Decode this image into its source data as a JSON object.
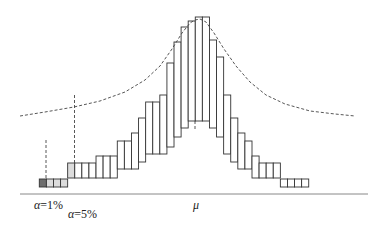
{
  "diagram": {
    "type": "stepped-box-histogram",
    "baseline": {
      "x1": 20,
      "x2": 368,
      "y": 194,
      "color": "#888888"
    },
    "column_width": 7.09,
    "column_start_x": 39.3,
    "columns": [
      {
        "top": 179,
        "bottom": 187,
        "fill": "#6e6e6e"
      },
      {
        "top": 179,
        "bottom": 187,
        "fill": "#dcdcdc"
      },
      {
        "top": 179,
        "bottom": 187,
        "fill": "#dcdcdc"
      },
      {
        "top": 179,
        "bottom": 187,
        "fill": "#dcdcdc"
      },
      {
        "top": 163,
        "bottom": 178,
        "fill": "#dcdcdc"
      },
      {
        "top": 163,
        "bottom": 178,
        "fill": "#ffffff"
      },
      {
        "top": 163,
        "bottom": 178,
        "fill": "#ffffff"
      },
      {
        "top": 163,
        "bottom": 178,
        "fill": "#ffffff"
      },
      {
        "top": 156,
        "bottom": 178,
        "fill": "#ffffff"
      },
      {
        "top": 156,
        "bottom": 178,
        "fill": "#ffffff"
      },
      {
        "top": 156,
        "bottom": 178,
        "fill": "#ffffff"
      },
      {
        "top": 141,
        "bottom": 169,
        "fill": "#ffffff"
      },
      {
        "top": 141,
        "bottom": 169,
        "fill": "#ffffff"
      },
      {
        "top": 133,
        "bottom": 169,
        "fill": "#ffffff"
      },
      {
        "top": 118,
        "bottom": 162,
        "fill": "#ffffff"
      },
      {
        "top": 102,
        "bottom": 154,
        "fill": "#ffffff"
      },
      {
        "top": 102,
        "bottom": 154,
        "fill": "#ffffff"
      },
      {
        "top": 95,
        "bottom": 154,
        "fill": "#ffffff"
      },
      {
        "top": 63,
        "bottom": 147,
        "fill": "#ffffff"
      },
      {
        "top": 42,
        "bottom": 137,
        "fill": "#ffffff"
      },
      {
        "top": 27,
        "bottom": 128,
        "fill": "#ffffff"
      },
      {
        "top": 21,
        "bottom": 121,
        "fill": "#ffffff"
      },
      {
        "top": 17,
        "bottom": 121,
        "fill": "#ffffff"
      },
      {
        "top": 17,
        "bottom": 121,
        "fill": "#ffffff"
      },
      {
        "top": 40,
        "bottom": 128,
        "fill": "#ffffff"
      },
      {
        "top": 57,
        "bottom": 137,
        "fill": "#ffffff"
      },
      {
        "top": 95,
        "bottom": 154,
        "fill": "#ffffff"
      },
      {
        "top": 118,
        "bottom": 162,
        "fill": "#ffffff"
      },
      {
        "top": 133,
        "bottom": 169,
        "fill": "#ffffff"
      },
      {
        "top": 141,
        "bottom": 169,
        "fill": "#ffffff"
      },
      {
        "top": 156,
        "bottom": 178,
        "fill": "#ffffff"
      },
      {
        "top": 163,
        "bottom": 178,
        "fill": "#ffffff"
      },
      {
        "top": 163,
        "bottom": 178,
        "fill": "#ffffff"
      },
      {
        "top": 163,
        "bottom": 178,
        "fill": "#ffffff"
      },
      {
        "top": 179,
        "bottom": 187,
        "fill": "#ffffff"
      },
      {
        "top": 179,
        "bottom": 187,
        "fill": "#ffffff"
      },
      {
        "top": 179,
        "bottom": 187,
        "fill": "#ffffff"
      },
      {
        "top": 179,
        "bottom": 187,
        "fill": "#ffffff"
      }
    ],
    "stroke_color": "#333333",
    "curve": {
      "style": "dashed",
      "color": "#444444",
      "points": [
        [
          20,
          116
        ],
        [
          45,
          112
        ],
        [
          74,
          107
        ],
        [
          100,
          101
        ],
        [
          125,
          92
        ],
        [
          145,
          80
        ],
        [
          160,
          66
        ],
        [
          172,
          49
        ],
        [
          182,
          33
        ],
        [
          190,
          23
        ],
        [
          195,
          20
        ],
        [
          200,
          19
        ],
        [
          206,
          22
        ],
        [
          214,
          33
        ],
        [
          224,
          49
        ],
        [
          236,
          66
        ],
        [
          250,
          82
        ],
        [
          266,
          95
        ],
        [
          285,
          104
        ],
        [
          310,
          111
        ],
        [
          335,
          114
        ],
        [
          355,
          116
        ]
      ]
    },
    "markers": [
      {
        "name": "alpha-1-marker",
        "x": 46,
        "y1": 140,
        "y2": 179
      },
      {
        "name": "alpha-5-marker",
        "x": 74.5,
        "y1": 95,
        "y2": 163
      },
      {
        "name": "mu-marker",
        "x": 195,
        "y1": 121,
        "y2": 129
      }
    ],
    "labels": {
      "alpha1": {
        "symbol": "α",
        "text": "=1%",
        "x": 34,
        "y": 198
      },
      "alpha5": {
        "symbol": "α",
        "text": "=5%",
        "x": 68,
        "y": 207
      },
      "mu": {
        "symbol": "μ",
        "x": 193,
        "y": 198
      }
    }
  }
}
